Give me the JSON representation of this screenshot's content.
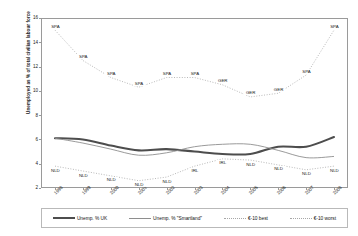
{
  "chart_data": {
    "type": "line",
    "title": "",
    "xlabel": "",
    "ylabel": "Unemployed as % of total civilian labour force",
    "ylim": [
      2,
      16
    ],
    "ytick_values": [
      2,
      4,
      6,
      8,
      10,
      12,
      14,
      16
    ],
    "grid": false,
    "legend_position": "bottom",
    "categories": [
      "1998",
      "1999",
      "2000",
      "2001",
      "2002",
      "2003",
      "2004",
      "2005",
      "2006",
      "2007",
      "2008"
    ],
    "series": [
      {
        "name": "Unemp. % UK",
        "style": "thick-solid",
        "color": "#4d4d4d",
        "values": [
          6.1,
          6.0,
          5.5,
          5.1,
          5.2,
          5.0,
          4.8,
          4.8,
          5.4,
          5.4,
          6.2
        ]
      },
      {
        "name": "Unemp. % \"Smartland\"",
        "style": "thin-solid",
        "color": "#8e8e8e",
        "values": [
          6.1,
          5.7,
          5.2,
          4.7,
          4.9,
          5.4,
          5.6,
          5.6,
          5.1,
          4.5,
          4.6
        ]
      },
      {
        "name": "€-10 best",
        "style": "dotted",
        "color": "#a7a7a7",
        "values": [
          3.8,
          3.4,
          3.0,
          2.6,
          2.9,
          3.8,
          4.4,
          4.3,
          3.9,
          3.5,
          3.8
        ],
        "point_labels": [
          "NLD",
          "NLD",
          "NLD",
          "NLD",
          "NLD",
          "IRL",
          "IRL",
          "NLD",
          "NLD",
          "NLD",
          "NLD"
        ]
      },
      {
        "name": "€-10 worst",
        "style": "dotted",
        "color": "#a7a7a7",
        "values": [
          15.0,
          12.5,
          11.1,
          10.3,
          11.1,
          11.1,
          10.5,
          9.5,
          9.8,
          11.3,
          15.0
        ],
        "point_labels": [
          "SPA",
          "SPA",
          "SPA",
          "SPA",
          "SPA",
          "SPA",
          "GER",
          "GER",
          "GER",
          "SPA",
          "SPA"
        ]
      }
    ],
    "legend_entries": [
      "Unemp. % UK",
      "Unemp. % \"Smartland\"",
      "€-10 best",
      "€-10 worst"
    ]
  }
}
